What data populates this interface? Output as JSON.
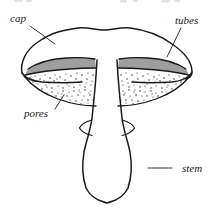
{
  "figure": {
    "style": "pen-and-ink line drawing",
    "ink_color": "#1a1a1a",
    "background_color": "#ffffff"
  },
  "labels": [
    {
      "id": "cap",
      "text": "cap",
      "text_x": 10,
      "text_y": 22,
      "leader": "M 30 26 L 55 44",
      "anchor": "start",
      "describes": "upper convex surface of the fruiting body"
    },
    {
      "id": "tubes",
      "text": "tubes",
      "text_x": 175,
      "text_y": 24,
      "leader": "M 181 28 L 167 57",
      "anchor": "start",
      "describes": "vertical hatched tube layer beneath the cap"
    },
    {
      "id": "pores",
      "text": "pores",
      "text_x": 24,
      "text_y": 117,
      "leader": "M 55 109 L 64 95",
      "anchor": "start",
      "describes": "stippled pore surface on the underside"
    },
    {
      "id": "stem",
      "text": "stem",
      "text_x": 182,
      "text_y": 172,
      "leader": "M 148 168 L 172 168",
      "anchor": "start",
      "describes": "club-shaped stalk supporting the cap"
    }
  ],
  "parts": {
    "cap_outline": "M 22 73 C 20 62 26 50 38 42 C 52 32 64 30 78 28 C 88 27 96 30 104 30 C 112 30 120 27 130 28 C 146 30 160 35 172 44 C 184 52 192 62 192 72 C 192 76 189 78 186 79",
    "cap_left_margin": "M 22 73 C 26 77 34 80 44 81 C 56 82 70 82 80 82 C 88 82 94 81 98 80",
    "cap_right_margin": "M 192 72 C 188 77 180 80 170 81 C 158 82 144 82 134 82 C 126 82 120 81 116 80",
    "left_tube_top": "M 28 69 C 38 62 52 59 66 58 C 78 57 88 58 95 59",
    "left_tube_bottom": "M 25 75 C 38 72 54 70 70 69 C 82 68 90 68 96 68",
    "left_pore_bottom": "M 24 76 C 32 86 44 94 58 99 C 72 104 86 106 96 106",
    "right_tube_top": "M 186 69 C 176 62 162 59 148 58 C 136 57 126 58 119 59",
    "right_tube_bottom": "M 189 75 C 176 72 160 70 144 69 C 132 68 124 68 118 68",
    "right_pore_bottom": "M 190 76 C 182 86 170 94 156 99 C 142 104 128 106 118 106",
    "stem_left": "M 97 60 C 96 80 94 100 92 118 C 90 132 86 142 84 152 C 82 164 82 176 86 188 C 90 196 96 200 104 202",
    "stem_right": "M 117 60 C 118 80 120 100 122 118 C 124 132 128 142 130 152 C 132 164 132 176 128 188 C 124 196 118 200 110 202",
    "stem_base": "M 104 202 C 106 203 108 203 110 202",
    "notch_left": "M 92 121 C 86 122 82 125 80 128 C 82 131 86 134 92 135",
    "notch_right": "M 122 121 C 128 122 132 125 134 128 C 132 131 128 134 122 135"
  },
  "textures": {
    "tube_hatch": {
      "type": "vertical-hatching",
      "description": "dense parallel vertical strokes filling the tube layer",
      "stroke_count_left": 34,
      "stroke_count_right": 34
    },
    "pore_stipple": {
      "type": "stipple",
      "description": "irregular scattered dots filling the pore surface",
      "dot_count_left": 96,
      "dot_count_right": 96
    }
  },
  "page_artifacts": {
    "description": "faint cropped ink fragments from the line of text above, clipped at the top edge",
    "visible": true
  }
}
